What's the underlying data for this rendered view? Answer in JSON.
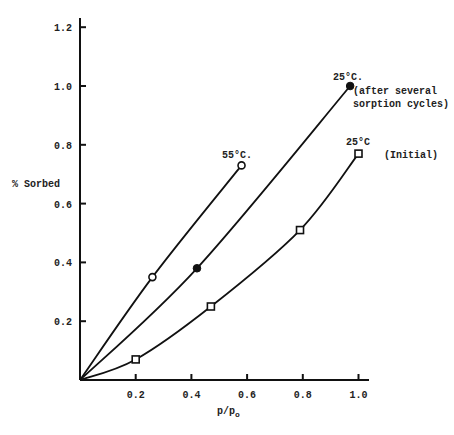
{
  "chart_data": {
    "type": "line",
    "title": "",
    "xlabel": "p/p_o",
    "ylabel": "% Sorbed",
    "xlim": [
      0,
      1.05
    ],
    "ylim": [
      0,
      1.25
    ],
    "grid": false,
    "legend": "none (curves labeled inline)",
    "x_ticks": [
      0.2,
      0.4,
      0.6,
      0.8,
      1.0
    ],
    "x_tick_labels": [
      "0.2",
      "0.4",
      "0.6",
      "0.8",
      "1.0"
    ],
    "y_ticks": [
      0.2,
      0.4,
      0.6,
      0.8,
      1.0,
      1.2
    ],
    "y_tick_labels": [
      "0.2",
      "0.4",
      "0.6",
      "0.8",
      "1.0",
      "1.2"
    ],
    "series": [
      {
        "name": "55°C.",
        "marker": "open-circle",
        "x": [
          0.26,
          0.58
        ],
        "y": [
          0.35,
          0.73
        ],
        "curve_through_origin": true,
        "label_lines": [
          "55°C."
        ]
      },
      {
        "name": "25°C. (after several sorption cycles)",
        "marker": "filled-circle",
        "x": [
          0.42,
          0.97
        ],
        "y": [
          0.38,
          1.0
        ],
        "curve_through_origin": true,
        "label_lines": [
          "25°C.",
          "(after several",
          "sorption cycles)"
        ]
      },
      {
        "name": "25°C (Initial)",
        "marker": "open-square",
        "x": [
          0.2,
          0.47,
          0.79,
          1.0
        ],
        "y": [
          0.07,
          0.25,
          0.51,
          0.77
        ],
        "curve_through_origin": true,
        "label_lines": [
          "25°C",
          "(Initial)"
        ]
      }
    ]
  },
  "labels": {
    "ylabel": "% Sorbed",
    "xlabel_main": "p/p",
    "xlabel_sub": "o"
  }
}
